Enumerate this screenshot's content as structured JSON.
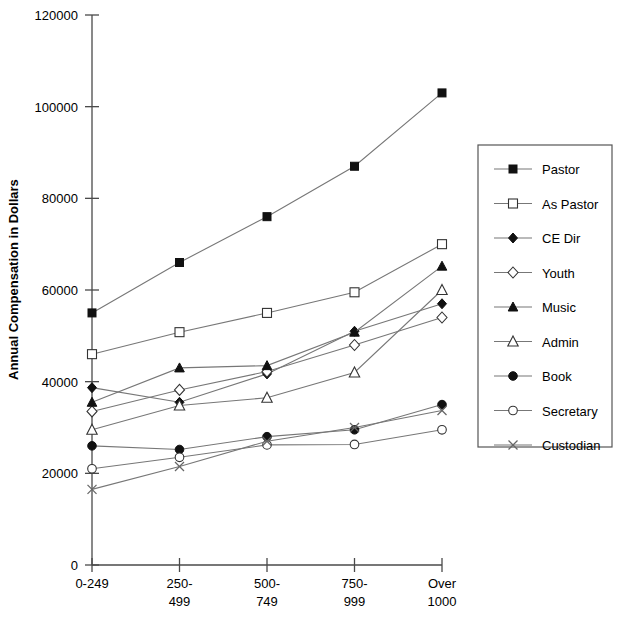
{
  "chart_data": {
    "type": "line",
    "title": "",
    "xlabel": "",
    "ylabel": "Annual Compensation in Dollars",
    "categories": [
      "0-249",
      "250-499",
      "500-749",
      "750-999",
      "Over 1000"
    ],
    "category_lines": [
      [
        "0-249"
      ],
      [
        "250-",
        "499"
      ],
      [
        "500-",
        "749"
      ],
      [
        "750-",
        "999"
      ],
      [
        "Over",
        "1000"
      ]
    ],
    "ylim": [
      0,
      120000
    ],
    "yticks": [
      0,
      20000,
      40000,
      60000,
      80000,
      100000,
      120000
    ],
    "ytick_labels": [
      "0",
      "20000",
      "40000",
      "60000",
      "80000",
      "100000",
      "120000"
    ],
    "grid": false,
    "legend_position": "right",
    "series": [
      {
        "name": "Pastor",
        "marker": "filled-square",
        "values": [
          55000,
          66000,
          76000,
          87000,
          103000
        ]
      },
      {
        "name": "As Pastor",
        "marker": "open-square",
        "values": [
          46000,
          50800,
          55000,
          59500,
          70000
        ]
      },
      {
        "name": "CE Dir",
        "marker": "filled-diamond",
        "values": [
          38700,
          35500,
          41700,
          51000,
          57000
        ]
      },
      {
        "name": "Youth",
        "marker": "open-diamond",
        "values": [
          33500,
          38200,
          42200,
          48000,
          54000
        ]
      },
      {
        "name": "Music",
        "marker": "filled-triangle",
        "values": [
          35500,
          43000,
          43500,
          50800,
          65200
        ]
      },
      {
        "name": "Admin",
        "marker": "open-triangle",
        "values": [
          29500,
          34800,
          36500,
          42000,
          60000
        ]
      },
      {
        "name": "Book",
        "marker": "filled-circle",
        "values": [
          26000,
          25200,
          28000,
          29500,
          35000
        ]
      },
      {
        "name": "Secretary",
        "marker": "open-circle",
        "values": [
          21000,
          23500,
          26200,
          26300,
          29500
        ]
      },
      {
        "name": "Custodian",
        "marker": "x-cross",
        "values": [
          16500,
          21500,
          27000,
          30000,
          33700
        ]
      }
    ]
  },
  "legend": {
    "entries": [
      {
        "label": "Pastor"
      },
      {
        "label": "As Pastor"
      },
      {
        "label": "CE Dir"
      },
      {
        "label": "Youth"
      },
      {
        "label": "Music"
      },
      {
        "label": "Admin"
      },
      {
        "label": "Book"
      },
      {
        "label": "Secretary"
      },
      {
        "label": "Custodian"
      }
    ]
  }
}
